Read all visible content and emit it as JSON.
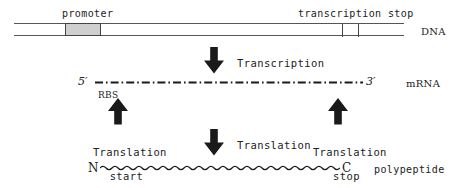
{
  "figure": {
    "width": 464,
    "height": 188,
    "background": "#ffffff",
    "ink_color": "#222222"
  },
  "dna_row": {
    "molecule_label": "DNA",
    "promoter_label": "promoter",
    "transcription_stop_label": "transcription stop",
    "promoter_fill": "#cfcfcf",
    "stroke": "#555555",
    "features": [
      {
        "name": "promoter",
        "kind": "box",
        "x": 65,
        "width": 36,
        "fill": "#cfcfcf"
      },
      {
        "name": "transcription-stop-tick-1",
        "kind": "tick",
        "x": 342
      },
      {
        "name": "transcription-stop-tick-2",
        "kind": "tick",
        "x": 358
      }
    ]
  },
  "transcription_step": {
    "arrow_direction": "down",
    "label": "Transcription"
  },
  "mrna_row": {
    "molecule_label": "mRNA",
    "five_prime": "5′",
    "three_prime": "3′",
    "rbs_label": "RBS",
    "line_style": "dash-dot"
  },
  "translation_markers": {
    "start": {
      "label_line1": "Translation",
      "label_line2": "start",
      "arrow_direction": "up"
    },
    "stop": {
      "label_line1": "Translation",
      "label_line2": "stop",
      "arrow_direction": "up"
    }
  },
  "translation_step": {
    "arrow_direction": "down",
    "label": "Translation"
  },
  "polypeptide_row": {
    "molecule_label": "polypeptide",
    "n_terminus": "N",
    "c_terminus": "C",
    "line_style": "wavy"
  }
}
